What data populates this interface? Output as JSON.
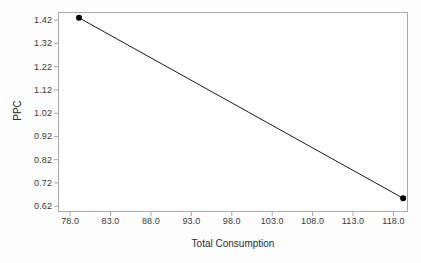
{
  "chart_data": {
    "type": "line",
    "title": "",
    "xlabel": "Total Consumption",
    "ylabel": "PPC",
    "xlim": [
      76.5,
      119.8
    ],
    "ylim": [
      0.595,
      1.455
    ],
    "grid": false,
    "legend": false,
    "marker": "filled-circle",
    "line_color": "#1a1a1a",
    "marker_color": "#000000",
    "frame_color": "#a9a9a9",
    "background_color": "#ffffff",
    "xticks": [
      "78.0",
      "83.0",
      "88.0",
      "93.0",
      "98.0",
      "103.0",
      "108.0",
      "113.0",
      "118.0"
    ],
    "xtick_values": [
      78.0,
      83.0,
      88.0,
      93.0,
      98.0,
      103.0,
      108.0,
      113.0,
      118.0
    ],
    "yticks": [
      "1.42",
      "1.32",
      "1.22",
      "1.12",
      "1.02",
      "0.92",
      "0.82",
      "0.72",
      "0.62"
    ],
    "ytick_values": [
      1.42,
      1.32,
      1.22,
      1.12,
      1.02,
      0.92,
      0.82,
      0.72,
      0.62
    ],
    "series": [
      {
        "name": "PPC",
        "x": [
          79.1,
          119.2
        ],
        "y": [
          1.43,
          0.654
        ]
      }
    ]
  }
}
